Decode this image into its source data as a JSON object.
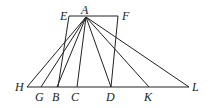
{
  "diagram": {
    "type": "geometric-figure",
    "points": {
      "A": {
        "label": "A",
        "x": 86,
        "y": 17
      },
      "E": {
        "label": "E",
        "x": 69,
        "y": 16
      },
      "F": {
        "label": "F",
        "x": 118,
        "y": 16
      },
      "H": {
        "label": "H",
        "x": 27,
        "y": 87
      },
      "G": {
        "label": "G",
        "x": 41,
        "y": 87
      },
      "B": {
        "label": "B",
        "x": 57,
        "y": 87
      },
      "C": {
        "label": "C",
        "x": 77,
        "y": 87
      },
      "D": {
        "label": "D",
        "x": 111,
        "y": 87
      },
      "K": {
        "label": "K",
        "x": 149,
        "y": 87
      },
      "L": {
        "label": "L",
        "x": 189,
        "y": 87
      }
    },
    "segments": [
      [
        "E",
        "F"
      ],
      [
        "E",
        "B"
      ],
      [
        "F",
        "D"
      ],
      [
        "H",
        "L"
      ],
      [
        "A",
        "H"
      ],
      [
        "A",
        "G"
      ],
      [
        "A",
        "B"
      ],
      [
        "A",
        "C"
      ],
      [
        "A",
        "D"
      ],
      [
        "A",
        "K"
      ],
      [
        "A",
        "L"
      ]
    ],
    "labels": {
      "A": "A",
      "E": "E",
      "F": "F",
      "H": "H",
      "G": "G",
      "B": "B",
      "C": "C",
      "D": "D",
      "K": "K",
      "L": "L"
    }
  }
}
